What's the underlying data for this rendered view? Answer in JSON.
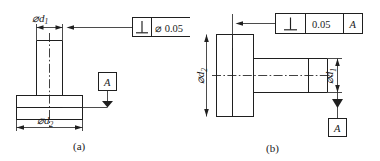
{
  "figure": {
    "background_color": "#ffffff",
    "line_color": "#1f1f1f",
    "panels": [
      {
        "id": "a",
        "caption": "(a)",
        "dimensions": [
          {
            "name": "top-shaft-diameter",
            "symbol": "⌀",
            "base": "d",
            "subscript": "1",
            "label": "⌀d₁"
          },
          {
            "name": "base-flange-diameter",
            "symbol": "⌀",
            "base": "d",
            "subscript": "2",
            "label": "⌀d₂"
          }
        ],
        "feature_control_frame": {
          "symbol": "perpendicularity",
          "symbol_glyph": "⊥",
          "tolerance": "⌀ 0.05",
          "tolerance_modifier": "⌀",
          "tolerance_value": "0.05",
          "datum": "A"
        },
        "datum_feature": {
          "letter": "A",
          "placement": "above-triangle",
          "triangle": "filled"
        }
      },
      {
        "id": "b",
        "caption": "(b)",
        "dimensions": [
          {
            "name": "flange-diameter",
            "symbol": "⌀",
            "base": "d",
            "subscript": "2",
            "label": "⌀d₂"
          },
          {
            "name": "shaft-diameter",
            "symbol": "⌀",
            "base": "d",
            "subscript": "1",
            "label": "⌀d₁"
          }
        ],
        "feature_control_frame": {
          "symbol": "perpendicularity",
          "symbol_glyph": "⊥",
          "tolerance": "0.05",
          "tolerance_modifier": "",
          "tolerance_value": "0.05",
          "datum": "A"
        },
        "datum_feature": {
          "letter": "A",
          "placement": "below-triangle",
          "triangle": "filled"
        }
      }
    ]
  }
}
